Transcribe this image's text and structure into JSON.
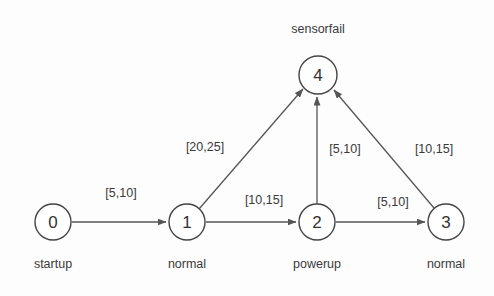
{
  "diagram": {
    "title_caption": "sensorfail",
    "background_color": "#fdfdfd",
    "stroke_color": "#444444",
    "text_color": "#3a3a3a",
    "nodes": [
      {
        "id": "0",
        "caption": "startup",
        "cx": 53,
        "cy": 222,
        "r": 18
      },
      {
        "id": "1",
        "caption": "normal",
        "cx": 187,
        "cy": 222,
        "r": 18
      },
      {
        "id": "2",
        "caption": "powerup",
        "cx": 317,
        "cy": 222,
        "r": 18
      },
      {
        "id": "3",
        "caption": "normal",
        "cx": 446,
        "cy": 222,
        "r": 18
      },
      {
        "id": "4",
        "caption": "sensorfail",
        "cx": 318,
        "cy": 75,
        "r": 19
      }
    ],
    "edges": [
      {
        "from": "0",
        "to": "1",
        "label": "[5,10]",
        "label_x": 121,
        "label_y": 186
      },
      {
        "from": "1",
        "to": "2",
        "label": "[10,15]",
        "label_x": 264,
        "label_y": 193
      },
      {
        "from": "2",
        "to": "3",
        "label": "[5,10]",
        "label_x": 393,
        "label_y": 195
      },
      {
        "from": "1",
        "to": "4",
        "label": "[20,25]",
        "label_x": 205,
        "label_y": 140
      },
      {
        "from": "2",
        "to": "4",
        "label": "[5,10]",
        "label_x": 345,
        "label_y": 142
      },
      {
        "from": "3",
        "to": "4",
        "label": "[10,15]",
        "label_x": 434,
        "label_y": 142
      }
    ]
  },
  "chart_data": {
    "type": "diagram",
    "title": "sensorfail",
    "nodes": [
      "0",
      "1",
      "2",
      "3",
      "4"
    ],
    "node_labels": [
      "startup",
      "normal",
      "powerup",
      "normal",
      "sensorfail"
    ],
    "edges": [
      {
        "source": "0",
        "target": "1",
        "interval": [
          5,
          10
        ]
      },
      {
        "source": "1",
        "target": "2",
        "interval": [
          10,
          15
        ]
      },
      {
        "source": "2",
        "target": "3",
        "interval": [
          5,
          10
        ]
      },
      {
        "source": "1",
        "target": "4",
        "interval": [
          20,
          25
        ]
      },
      {
        "source": "2",
        "target": "4",
        "interval": [
          5,
          10
        ]
      },
      {
        "source": "3",
        "target": "4",
        "interval": [
          10,
          15
        ]
      }
    ]
  }
}
